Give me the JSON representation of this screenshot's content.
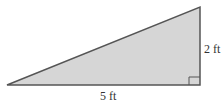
{
  "diagram": {
    "shape": "right-triangle",
    "fill_color": "#d6d6d6",
    "stroke_color": "#555555",
    "labels": {
      "base": "5 ft",
      "height": "2 ft"
    },
    "right_angle_marker": true
  }
}
